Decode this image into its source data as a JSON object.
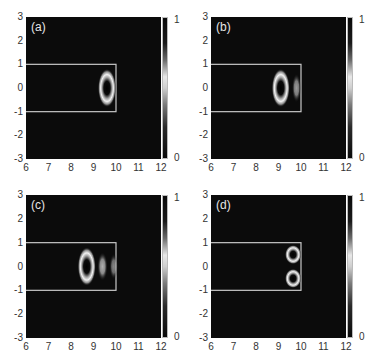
{
  "chart_data": [
    {
      "type": "heatmap",
      "panel_label": "(a)",
      "xlim": [
        6,
        12
      ],
      "ylim": [
        -3,
        3
      ],
      "x_ticks": [
        "6",
        "7",
        "8",
        "9",
        "10",
        "11",
        "12"
      ],
      "y_ticks": [
        "3",
        "2",
        "1",
        "0",
        "-1",
        "-2",
        "-3"
      ],
      "colorbar": {
        "min": "0",
        "max": "1"
      },
      "waveguide_rect": {
        "x0": 6,
        "x1": 10,
        "y0": -1,
        "y1": 1
      },
      "features": [
        {
          "shape": "ring",
          "cx": 9.6,
          "cy": 0,
          "rx": 0.3,
          "ry": 0.6,
          "intensity": 1.0
        }
      ]
    },
    {
      "type": "heatmap",
      "panel_label": "(b)",
      "xlim": [
        6,
        12
      ],
      "ylim": [
        -3,
        3
      ],
      "x_ticks": [
        "6",
        "7",
        "8",
        "9",
        "10",
        "11",
        "12"
      ],
      "y_ticks": [
        "3",
        "2",
        "1",
        "0",
        "-1",
        "-2",
        "-3"
      ],
      "colorbar": {
        "min": "0",
        "max": "1"
      },
      "waveguide_rect": {
        "x0": 6,
        "x1": 10,
        "y0": -1,
        "y1": 1
      },
      "features": [
        {
          "shape": "ring",
          "cx": 9.1,
          "cy": 0,
          "rx": 0.3,
          "ry": 0.6,
          "intensity": 1.0
        },
        {
          "shape": "blob",
          "cx": 9.8,
          "cy": 0,
          "rx": 0.15,
          "ry": 0.45,
          "intensity": 0.7
        }
      ]
    },
    {
      "type": "heatmap",
      "panel_label": "(c)",
      "xlim": [
        6,
        12
      ],
      "ylim": [
        -3,
        3
      ],
      "x_ticks": [
        "6",
        "7",
        "8",
        "9",
        "10",
        "11",
        "12"
      ],
      "y_ticks": [
        "3",
        "2",
        "1",
        "0",
        "-1",
        "-2",
        "-3"
      ],
      "colorbar": {
        "min": "0",
        "max": "1"
      },
      "waveguide_rect": {
        "x0": 6,
        "x1": 10,
        "y0": -1,
        "y1": 1
      },
      "features": [
        {
          "shape": "ring",
          "cx": 8.7,
          "cy": 0,
          "rx": 0.3,
          "ry": 0.6,
          "intensity": 1.0
        },
        {
          "shape": "blob",
          "cx": 9.4,
          "cy": 0,
          "rx": 0.17,
          "ry": 0.45,
          "intensity": 0.8
        },
        {
          "shape": "blob",
          "cx": 9.9,
          "cy": 0,
          "rx": 0.14,
          "ry": 0.4,
          "intensity": 0.6
        }
      ]
    },
    {
      "type": "heatmap",
      "panel_label": "(d)",
      "xlim": [
        6,
        12
      ],
      "ylim": [
        -3,
        3
      ],
      "x_ticks": [
        "6",
        "7",
        "8",
        "9",
        "10",
        "11",
        "12"
      ],
      "y_ticks": [
        "3",
        "2",
        "1",
        "0",
        "-1",
        "-2",
        "-3"
      ],
      "colorbar": {
        "min": "0",
        "max": "1"
      },
      "waveguide_rect": {
        "x0": 6,
        "x1": 10,
        "y0": -1,
        "y1": 1
      },
      "features": [
        {
          "shape": "ring",
          "cx": 9.65,
          "cy": 0.5,
          "rx": 0.27,
          "ry": 0.3,
          "intensity": 1.0
        },
        {
          "shape": "ring",
          "cx": 9.65,
          "cy": -0.5,
          "rx": 0.27,
          "ry": 0.3,
          "intensity": 1.0
        }
      ]
    }
  ],
  "panels": [
    {
      "label": "(a)"
    },
    {
      "label": "(b)"
    },
    {
      "label": "(c)"
    },
    {
      "label": "(d)"
    }
  ],
  "axes": {
    "x_ticks": [
      "6",
      "7",
      "8",
      "9",
      "10",
      "11",
      "12"
    ],
    "y_ticks": [
      "3",
      "2",
      "1",
      "0",
      "-1",
      "-2",
      "-3"
    ],
    "cbar_max": "1",
    "cbar_min": "0"
  }
}
